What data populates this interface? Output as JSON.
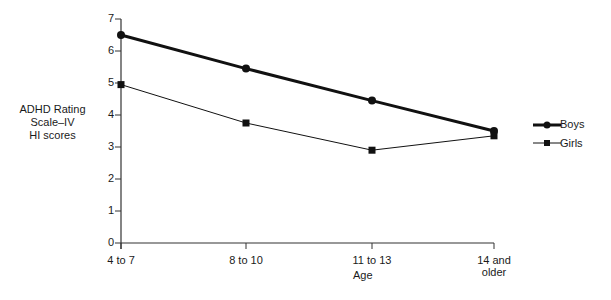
{
  "chart_data": {
    "type": "line",
    "title": "",
    "xlabel": "Age",
    "ylabel": "ADHD Rating Scale–IV HI scores",
    "ylabel_lines": [
      "ADHD Rating",
      "Scale–IV",
      "HI scores"
    ],
    "categories": [
      "4 to 7",
      "8 to 10",
      "11 to 13",
      "14 and older"
    ],
    "category_lines": [
      [
        "4 to 7"
      ],
      [
        "8 to 10"
      ],
      [
        "11 to 13"
      ],
      [
        "14 and",
        "older"
      ]
    ],
    "ylim": [
      0,
      7
    ],
    "yticks": [
      0,
      1,
      2,
      3,
      4,
      5,
      6,
      7
    ],
    "grid": false,
    "legend_position": "right",
    "series": [
      {
        "name": "Boys",
        "marker": "circle",
        "line_width": "thick",
        "values": [
          6.5,
          5.45,
          4.45,
          3.5
        ]
      },
      {
        "name": "Girls",
        "marker": "square",
        "line_width": "thin",
        "values": [
          4.95,
          3.75,
          2.9,
          3.35
        ]
      }
    ]
  },
  "legend": {
    "boys_label": "Boys",
    "girls_label": "Girls"
  }
}
